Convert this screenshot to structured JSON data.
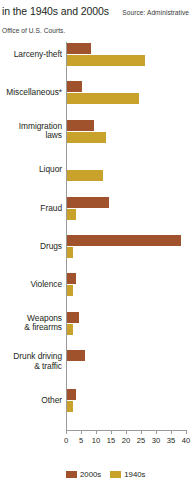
{
  "header": {
    "title": "in the 1940s and 2000s",
    "source": "Source: Administrative Office of U.S. Courts."
  },
  "colors": {
    "series_2000s": "#a0522d",
    "series_1940s": "#c8a22a",
    "axis": "#9a9a9a",
    "text": "#231f20",
    "background": "#ffffff"
  },
  "legend": {
    "position": "bottom-left",
    "items": [
      {
        "label": "2000s",
        "color": "#a0522d"
      },
      {
        "label": "1940s",
        "color": "#c8a22a"
      }
    ]
  },
  "axis": {
    "ticks": [
      "0",
      "5",
      "10",
      "15",
      "20",
      "25",
      "30",
      "35",
      "40"
    ],
    "tick_values": [
      0,
      5,
      10,
      15,
      20,
      25,
      30,
      35,
      40
    ]
  },
  "categories": [
    "Larceny-theft",
    "Miscellaneous*",
    "Immigration laws",
    "Liquor",
    "Fraud",
    "Drugs",
    "Violence",
    "Weapons & firearms",
    "Drunk driving & traffic",
    "Other"
  ],
  "category_labels": [
    {
      "lines": [
        "Larceny-theft"
      ]
    },
    {
      "lines": [
        "Miscellaneous*"
      ]
    },
    {
      "lines": [
        "Immigration",
        "laws"
      ]
    },
    {
      "lines": [
        "Liquor"
      ]
    },
    {
      "lines": [
        "Fraud"
      ]
    },
    {
      "lines": [
        "Drugs"
      ]
    },
    {
      "lines": [
        "Violence"
      ]
    },
    {
      "lines": [
        "Weapons",
        "& firearms"
      ]
    },
    {
      "lines": [
        "Drunk driving",
        "& traffic"
      ]
    },
    {
      "lines": [
        "Other"
      ]
    }
  ],
  "chart_data": {
    "type": "bar",
    "orientation": "horizontal",
    "title": "in the 1940s and 2000s",
    "subtitle": "Source: Administrative Office of U.S. Courts.",
    "xlabel": "",
    "ylabel": "",
    "xlim": [
      0,
      40
    ],
    "grid": false,
    "legend_position": "bottom-left",
    "categories": [
      "Larceny-theft",
      "Miscellaneous*",
      "Immigration laws",
      "Liquor",
      "Fraud",
      "Drugs",
      "Violence",
      "Weapons & firearms",
      "Drunk driving & traffic",
      "Other"
    ],
    "series": [
      {
        "name": "2000s",
        "color": "#a0522d",
        "values": [
          8,
          5,
          9,
          0,
          14,
          38,
          3,
          4,
          6,
          3
        ]
      },
      {
        "name": "1940s",
        "color": "#c8a22a",
        "values": [
          26,
          24,
          13,
          12,
          3,
          2,
          2,
          2,
          0,
          2
        ]
      }
    ]
  }
}
